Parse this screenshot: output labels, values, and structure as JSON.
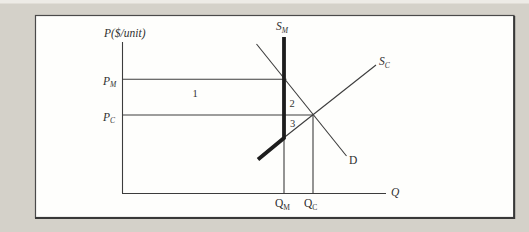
{
  "figure": {
    "colors": {
      "matte_background": "#d4d1c9",
      "page_top_strip": "#edebe6",
      "panel_fill": "#fefefc",
      "panel_border": "#4a4a4a",
      "thin_line": "#3c3c3c",
      "thick_curve": "#1d1d1d",
      "text": "#2f2f2f"
    },
    "labels": {
      "y_axis": "P($/unit)",
      "x_axis": "Q",
      "supply_monopoly": {
        "main": "S",
        "sub": "M"
      },
      "supply_competitive": {
        "main": "S",
        "sub": "C"
      },
      "demand": "D",
      "price_monopoly": {
        "main": "P",
        "sub": "M"
      },
      "price_competitive": {
        "main": "P",
        "sub": "C"
      },
      "quantity_monopoly": {
        "main": "Q",
        "sub": "M"
      },
      "quantity_competitive": {
        "main": "Q",
        "sub": "C"
      },
      "region_1": "1",
      "region_2": "2",
      "region_3": "3"
    }
  }
}
